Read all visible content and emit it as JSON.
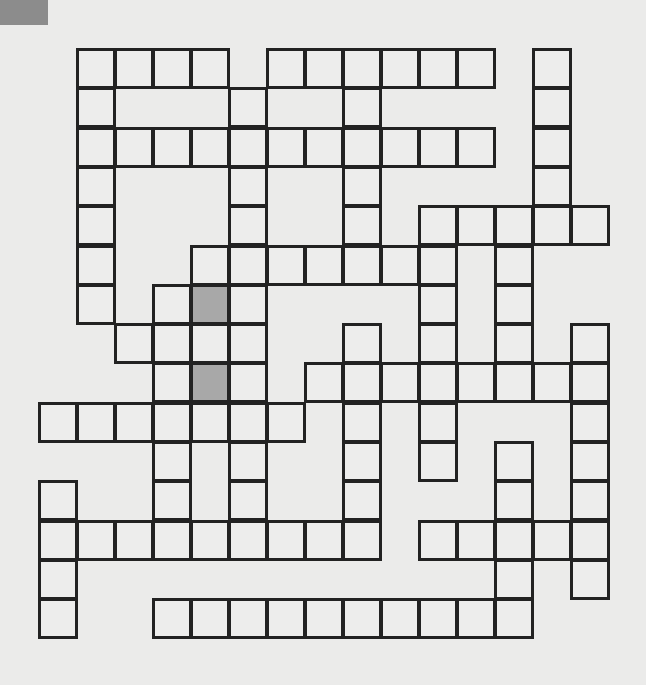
{
  "puzzle": {
    "type": "crossword-grid",
    "rows": 15,
    "cols": 15,
    "origin_x": 39,
    "origin_y": 49,
    "cell_w": 38,
    "cell_h": 39.3,
    "colors": {
      "cell": "#ededec",
      "shaded": "#a8a8a8",
      "border": "#222222",
      "background": "#ebebea",
      "corner": "#8c8c8c"
    },
    "grid_rows": [
      {
        "row": 0,
        "cells": [
          1,
          2,
          3,
          4,
          6,
          7,
          8,
          9,
          10,
          11,
          13
        ]
      },
      {
        "row": 1,
        "cells": [
          1,
          5,
          8,
          13
        ]
      },
      {
        "row": 2,
        "cells": [
          1,
          2,
          3,
          4,
          5,
          6,
          7,
          8,
          9,
          10,
          11,
          13
        ]
      },
      {
        "row": 3,
        "cells": [
          1,
          5,
          8,
          13
        ]
      },
      {
        "row": 4,
        "cells": [
          1,
          5,
          8,
          10,
          11,
          12,
          13,
          14
        ]
      },
      {
        "row": 5,
        "cells": [
          1,
          4,
          5,
          6,
          7,
          8,
          9,
          10,
          12
        ]
      },
      {
        "row": 6,
        "cells": [
          1,
          3,
          4,
          5,
          10,
          12
        ]
      },
      {
        "row": 7,
        "cells": [
          2,
          3,
          4,
          5,
          8,
          10,
          12,
          14
        ]
      },
      {
        "row": 8,
        "cells": [
          3,
          4,
          5,
          7,
          8,
          9,
          10,
          11,
          12,
          13,
          14
        ]
      },
      {
        "row": 9,
        "cells": [
          0,
          1,
          2,
          3,
          4,
          5,
          6,
          8,
          10,
          14
        ]
      },
      {
        "row": 10,
        "cells": [
          3,
          5,
          8,
          10,
          12,
          14
        ]
      },
      {
        "row": 11,
        "cells": [
          0,
          3,
          5,
          8,
          12,
          14
        ]
      },
      {
        "row": 12,
        "cells": [
          0,
          1,
          2,
          3,
          4,
          5,
          6,
          7,
          8,
          10,
          11,
          12,
          13,
          14
        ]
      },
      {
        "row": 13,
        "cells": [
          0,
          12,
          14
        ]
      },
      {
        "row": 14,
        "cells": [
          0,
          3,
          4,
          5,
          6,
          7,
          8,
          9,
          10,
          11,
          12
        ]
      }
    ],
    "shaded_cells": [
      {
        "row": 6,
        "col": 4
      },
      {
        "row": 8,
        "col": 4
      }
    ]
  }
}
